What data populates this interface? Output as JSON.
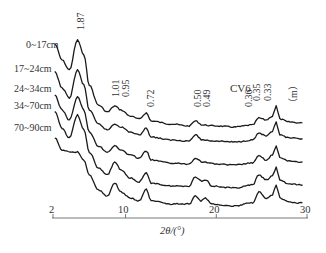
{
  "chart_data": {
    "type": "line",
    "title": "CV6",
    "xlabel": "2θ/(°)",
    "ylabel": "",
    "unit_label": "（m）",
    "xlim": [
      2,
      30
    ],
    "x_ticks": [
      "2",
      "10",
      "20",
      "30"
    ],
    "grid": false,
    "peak_labels": [
      "1.87",
      "1.01",
      "0.95",
      "0.72",
      "0.50",
      "0.49",
      "0.36",
      "0.35",
      "0.33"
    ],
    "peak_positions_2theta": [
      4.7,
      8.8,
      9.3,
      12.3,
      17.7,
      18.1,
      24.7,
      25.3,
      26.6
    ],
    "series": [
      {
        "name": "0~17cm",
        "offset_px": 0,
        "points": [
          [
            2.2,
            44
          ],
          [
            3,
            60
          ],
          [
            3.8,
            70
          ],
          [
            4.7,
            40
          ],
          [
            5.4,
            55
          ],
          [
            6,
            85
          ],
          [
            7,
            105
          ],
          [
            8,
            112
          ],
          [
            8.8,
            106
          ],
          [
            9.5,
            110
          ],
          [
            10.5,
            116
          ],
          [
            11.5,
            119
          ],
          [
            12.3,
            113
          ],
          [
            12.8,
            121
          ],
          [
            15,
            124
          ],
          [
            17,
            126
          ],
          [
            17.7,
            121
          ],
          [
            18.5,
            125
          ],
          [
            20,
            126
          ],
          [
            22,
            127
          ],
          [
            24,
            125
          ],
          [
            24.7,
            118
          ],
          [
            25.5,
            120
          ],
          [
            26.2,
            116
          ],
          [
            26.6,
            106
          ],
          [
            27,
            119
          ],
          [
            28,
            122
          ],
          [
            29.5,
            123
          ]
        ]
      },
      {
        "name": "17~24cm",
        "offset_px": 0,
        "points": [
          [
            2.2,
            72
          ],
          [
            3,
            88
          ],
          [
            3.8,
            98
          ],
          [
            4.7,
            70
          ],
          [
            5.4,
            85
          ],
          [
            6,
            110
          ],
          [
            7,
            124
          ],
          [
            8,
            130
          ],
          [
            8.8,
            124
          ],
          [
            9.5,
            127
          ],
          [
            10.5,
            132
          ],
          [
            11.5,
            135
          ],
          [
            12.3,
            128
          ],
          [
            12.8,
            137
          ],
          [
            15,
            140
          ],
          [
            17,
            141
          ],
          [
            17.7,
            135
          ],
          [
            18.5,
            140
          ],
          [
            20,
            141
          ],
          [
            22,
            142
          ],
          [
            24,
            140
          ],
          [
            24.7,
            133
          ],
          [
            25.5,
            136
          ],
          [
            26.2,
            132
          ],
          [
            26.6,
            122
          ],
          [
            27,
            135
          ],
          [
            28,
            138
          ],
          [
            29.5,
            139
          ]
        ]
      },
      {
        "name": "24~34cm",
        "offset_px": 0,
        "points": [
          [
            2.2,
            95
          ],
          [
            3,
            110
          ],
          [
            3.8,
            120
          ],
          [
            4.7,
            97
          ],
          [
            5.4,
            110
          ],
          [
            6,
            132
          ],
          [
            7,
            146
          ],
          [
            8,
            152
          ],
          [
            8.8,
            146
          ],
          [
            9.5,
            150
          ],
          [
            10.5,
            155
          ],
          [
            11.5,
            158
          ],
          [
            12.3,
            151
          ],
          [
            12.8,
            160
          ],
          [
            15,
            163
          ],
          [
            17,
            164
          ],
          [
            17.7,
            158
          ],
          [
            18.5,
            162
          ],
          [
            20,
            164
          ],
          [
            22,
            165
          ],
          [
            24,
            163
          ],
          [
            24.7,
            156
          ],
          [
            25.5,
            160
          ],
          [
            26.2,
            155
          ],
          [
            26.6,
            146
          ],
          [
            27,
            158
          ],
          [
            28,
            161
          ],
          [
            29.5,
            162
          ]
        ]
      },
      {
        "name": "34~70cm",
        "offset_px": 0,
        "points": [
          [
            2.2,
            112
          ],
          [
            3,
            128
          ],
          [
            3.8,
            138
          ],
          [
            4.7,
            115
          ],
          [
            5.4,
            130
          ],
          [
            6,
            152
          ],
          [
            7,
            168
          ],
          [
            8,
            175
          ],
          [
            8.8,
            162
          ],
          [
            9.5,
            170
          ],
          [
            10.5,
            178
          ],
          [
            11.5,
            182
          ],
          [
            12.3,
            173
          ],
          [
            12.8,
            183
          ],
          [
            15,
            186
          ],
          [
            17,
            186
          ],
          [
            17.7,
            177
          ],
          [
            18.4,
            181
          ],
          [
            18.9,
            180
          ],
          [
            19.5,
            186
          ],
          [
            22,
            188
          ],
          [
            24,
            185
          ],
          [
            24.7,
            175
          ],
          [
            25.5,
            180
          ],
          [
            26.2,
            176
          ],
          [
            26.6,
            167
          ],
          [
            27,
            180
          ],
          [
            28,
            184
          ],
          [
            29.5,
            185
          ]
        ]
      },
      {
        "name": "70~90cm",
        "offset_px": 0,
        "points": [
          [
            2.2,
            138
          ],
          [
            3,
            150
          ],
          [
            4,
            152
          ],
          [
            4.7,
            152
          ],
          [
            5.4,
            160
          ],
          [
            6,
            175
          ],
          [
            7,
            190
          ],
          [
            8,
            196
          ],
          [
            8.8,
            183
          ],
          [
            9.5,
            192
          ],
          [
            10.5,
            198
          ],
          [
            11.5,
            201
          ],
          [
            12.3,
            189
          ],
          [
            12.8,
            201
          ],
          [
            15,
            204
          ],
          [
            17,
            204
          ],
          [
            17.7,
            196
          ],
          [
            18.3,
            201
          ],
          [
            18.8,
            198
          ],
          [
            19.5,
            204
          ],
          [
            22,
            206
          ],
          [
            24,
            203
          ],
          [
            24.7,
            192
          ],
          [
            25.5,
            199
          ],
          [
            26.2,
            195
          ],
          [
            26.6,
            185
          ],
          [
            27,
            198
          ],
          [
            28,
            202
          ],
          [
            29.5,
            203
          ]
        ]
      }
    ]
  },
  "labels": {
    "series_names": [
      "0~17cm",
      "17~24cm",
      "24~34cm",
      "34~70cm",
      "70~90cm"
    ]
  }
}
